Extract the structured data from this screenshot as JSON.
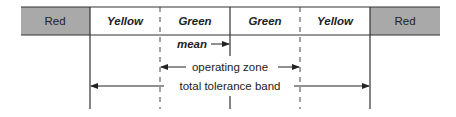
{
  "diagram": {
    "zones": [
      {
        "label": "Red",
        "style": "shaded",
        "color": "#a9a9a9"
      },
      {
        "label": "Yellow",
        "style": "bold-italic",
        "color": "#ffffff"
      },
      {
        "label": "Green",
        "style": "bold-italic",
        "color": "#ffffff"
      },
      {
        "label": "Green",
        "style": "bold-italic",
        "color": "#ffffff"
      },
      {
        "label": "Yellow",
        "style": "bold-italic",
        "color": "#ffffff"
      },
      {
        "label": "Red",
        "style": "shaded",
        "color": "#a9a9a9"
      }
    ],
    "annotations": {
      "mean": "mean",
      "operating_zone": "operating zone",
      "total_tolerance_band": "total tolerance band"
    },
    "colors": {
      "red_zone_fill": "#a9a9a9",
      "line": "#333333"
    }
  }
}
